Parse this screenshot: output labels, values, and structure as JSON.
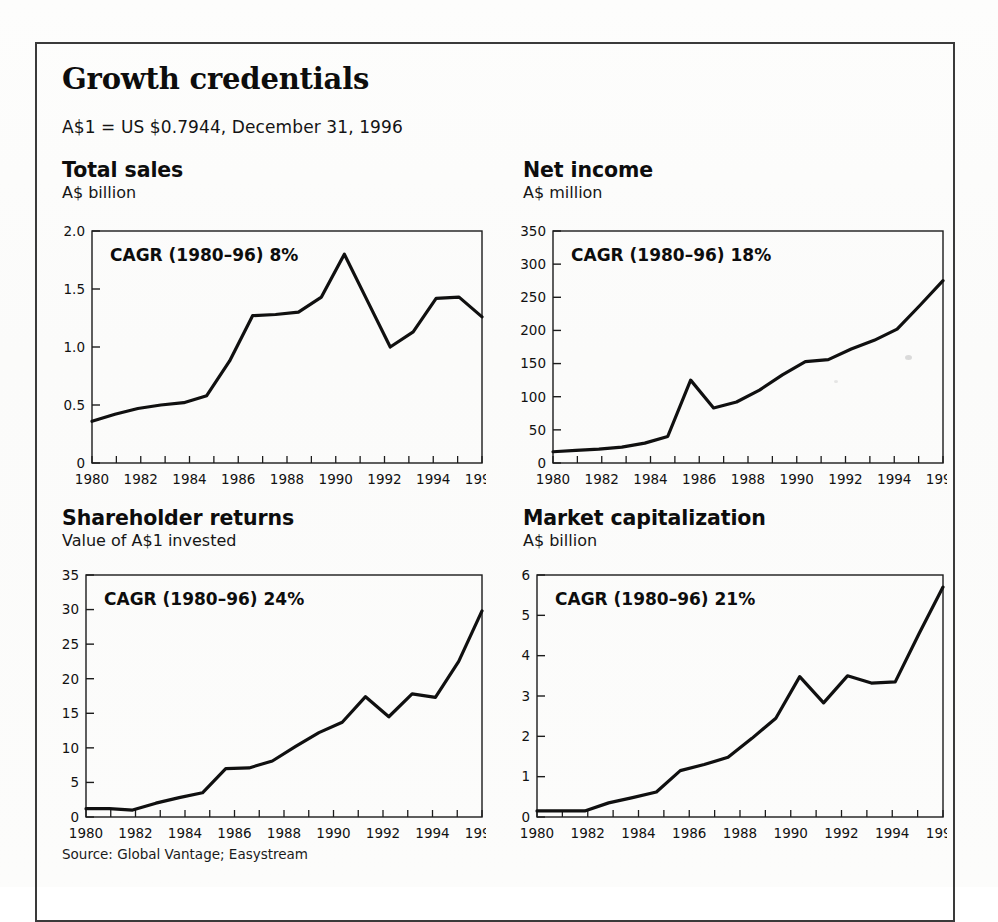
{
  "exhibit": {
    "title": "Growth credentials",
    "fx_note": "A$1 = US $0.7944, December 31, 1996",
    "source": "Source: Global Vantage; Easystream"
  },
  "chart_data": [
    {
      "id": "total-sales",
      "type": "line",
      "title": "Total sales",
      "subtitle": "A$ billion",
      "annotation": "CAGR (1980–96) 8%",
      "xlabel": "",
      "ylabel": "A$ billion",
      "grid": false,
      "legend": "none",
      "xlim": [
        1980,
        1996
      ],
      "ylim": [
        0,
        2.0
      ],
      "yticks": [
        0,
        0.5,
        1.0,
        1.5,
        2.0
      ],
      "ytick_labels": [
        "0",
        "0.5",
        "1.0",
        "1.5",
        "2.0"
      ],
      "xticks": [
        1980,
        1982,
        1984,
        1986,
        1988,
        1990,
        1992,
        1994,
        1996
      ],
      "xtick_labels": [
        "1980",
        "1982",
        "1984",
        "1986",
        "1988",
        "1990",
        "1992",
        "1994",
        "1996"
      ],
      "x": [
        1980,
        1981,
        1982,
        1983,
        1984,
        1985,
        1986,
        1987,
        1988,
        1989,
        1990,
        1991,
        1992,
        1993,
        1994,
        1995,
        1996
      ],
      "values": [
        0.36,
        0.42,
        0.47,
        0.5,
        0.52,
        0.58,
        0.88,
        1.27,
        1.28,
        1.3,
        1.43,
        1.8,
        1.4,
        1.0,
        1.13,
        1.42,
        1.43,
        1.26
      ]
    },
    {
      "id": "net-income",
      "type": "line",
      "title": "Net income",
      "subtitle": "A$ million",
      "annotation": "CAGR (1980–96) 18%",
      "xlabel": "",
      "ylabel": "A$ million",
      "grid": false,
      "legend": "none",
      "xlim": [
        1980,
        1996
      ],
      "ylim": [
        0,
        350
      ],
      "yticks": [
        0,
        50,
        100,
        150,
        200,
        250,
        300,
        350
      ],
      "ytick_labels": [
        "0",
        "50",
        "100",
        "150",
        "200",
        "250",
        "300",
        "350"
      ],
      "xticks": [
        1980,
        1982,
        1984,
        1986,
        1988,
        1990,
        1992,
        1994,
        1996
      ],
      "xtick_labels": [
        "1980",
        "1982",
        "1984",
        "1986",
        "1988",
        "1990",
        "1992",
        "1994",
        "1996"
      ],
      "x": [
        1980,
        1981,
        1982,
        1983,
        1984,
        1985,
        1986,
        1987,
        1988,
        1989,
        1990,
        1991,
        1992,
        1993,
        1994,
        1995,
        1996
      ],
      "values": [
        17,
        19,
        21,
        24,
        30,
        40,
        125,
        83,
        92,
        110,
        133,
        153,
        156,
        172,
        185,
        202,
        238,
        275
      ]
    },
    {
      "id": "shareholder-returns",
      "type": "line",
      "title": "Shareholder returns",
      "subtitle": "Value of A$1 invested",
      "annotation": "CAGR (1980–96) 24%",
      "xlabel": "",
      "ylabel": "Value of A$1 invested",
      "grid": false,
      "legend": "none",
      "xlim": [
        1980,
        1996
      ],
      "ylim": [
        0,
        35
      ],
      "yticks": [
        0,
        5,
        10,
        15,
        20,
        25,
        30,
        35
      ],
      "ytick_labels": [
        "0",
        "5",
        "10",
        "15",
        "20",
        "25",
        "30",
        "35"
      ],
      "xticks": [
        1980,
        1982,
        1984,
        1986,
        1988,
        1990,
        1992,
        1994,
        1996
      ],
      "xtick_labels": [
        "1980",
        "1982",
        "1984",
        "1986",
        "1988",
        "1990",
        "1992",
        "1994",
        "1996"
      ],
      "x": [
        1980,
        1981,
        1982,
        1983,
        1984,
        1985,
        1986,
        1987,
        1988,
        1989,
        1990,
        1991,
        1992,
        1993,
        1994,
        1995,
        1996
      ],
      "values": [
        1.2,
        1.2,
        1.0,
        2.0,
        2.8,
        3.5,
        7.0,
        7.1,
        8.1,
        10.2,
        12.2,
        13.7,
        17.4,
        14.5,
        17.8,
        17.3,
        22.5,
        29.8
      ]
    },
    {
      "id": "market-capitalization",
      "type": "line",
      "title": "Market capitalization",
      "subtitle": "A$ billion",
      "annotation": "CAGR (1980–96) 21%",
      "xlabel": "",
      "ylabel": "A$ billion",
      "grid": false,
      "legend": "none",
      "xlim": [
        1980,
        1996
      ],
      "ylim": [
        0,
        6
      ],
      "yticks": [
        0,
        1,
        2,
        3,
        4,
        5,
        6
      ],
      "ytick_labels": [
        "0",
        "1",
        "2",
        "3",
        "4",
        "5",
        "6"
      ],
      "xticks": [
        1980,
        1982,
        1984,
        1986,
        1988,
        1990,
        1992,
        1994,
        1996
      ],
      "xtick_labels": [
        "1980",
        "1982",
        "1984",
        "1986",
        "1988",
        "1990",
        "1992",
        "1994",
        "1996"
      ],
      "x": [
        1980,
        1981,
        1982,
        1983,
        1984,
        1985,
        1986,
        1987,
        1988,
        1989,
        1990,
        1991,
        1992,
        1993,
        1994,
        1995,
        1996
      ],
      "values": [
        0.15,
        0.15,
        0.15,
        0.35,
        0.48,
        0.62,
        1.15,
        1.3,
        1.48,
        1.95,
        2.45,
        3.48,
        2.83,
        3.5,
        3.32,
        3.35,
        4.55,
        5.7
      ]
    }
  ]
}
